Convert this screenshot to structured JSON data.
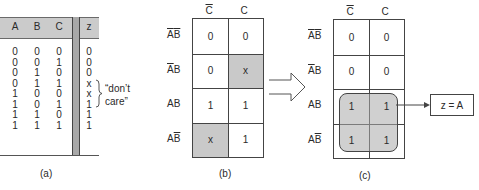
{
  "truth_table": {
    "headers": [
      "A",
      "B",
      "C",
      "z"
    ],
    "rows": [
      [
        "0",
        "0",
        "0",
        "0"
      ],
      [
        "0",
        "0",
        "1",
        "0"
      ],
      [
        "0",
        "1",
        "0",
        "0"
      ],
      [
        "0",
        "1",
        "1",
        "x"
      ],
      [
        "1",
        "0",
        "0",
        "x"
      ],
      [
        "1",
        "0",
        "1",
        "1"
      ],
      [
        "1",
        "1",
        "0",
        "1"
      ],
      [
        "1",
        "1",
        "1",
        "1"
      ]
    ],
    "annotation_line1": "“don’t",
    "annotation_line2": "care”",
    "caption": "(a)"
  },
  "kmap_b": {
    "col_labels": [
      "C",
      "C"
    ],
    "col_overline": [
      true,
      false
    ],
    "row_labels": [
      {
        "a": "A",
        "a_bar": true,
        "b": "B",
        "b_bar": true
      },
      {
        "a": "A",
        "a_bar": true,
        "b": "B",
        "b_bar": false
      },
      {
        "a": "A",
        "a_bar": false,
        "b": "B",
        "b_bar": false
      },
      {
        "a": "A",
        "a_bar": false,
        "b": "B",
        "b_bar": true
      }
    ],
    "cells": [
      [
        "0",
        "0"
      ],
      [
        "0",
        "x"
      ],
      [
        "1",
        "1"
      ],
      [
        "x",
        "1"
      ]
    ],
    "shaded": [
      [
        false,
        false
      ],
      [
        false,
        true
      ],
      [
        false,
        false
      ],
      [
        true,
        false
      ]
    ],
    "caption": "(b)"
  },
  "kmap_c": {
    "col_labels": [
      "C",
      "C"
    ],
    "cells": [
      [
        "0",
        "0"
      ],
      [
        "0",
        "0"
      ],
      [
        "1",
        "1"
      ],
      [
        "1",
        "1"
      ]
    ],
    "result": "z = A",
    "caption": "(c)"
  },
  "colors": {
    "shade": "#c9c9c9",
    "header": "#cbcbcb",
    "line": "#444444"
  }
}
